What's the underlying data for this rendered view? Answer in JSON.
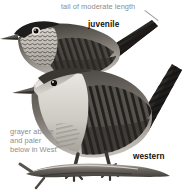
{
  "plate": {
    "kind": "field-guide-bird-illustration",
    "subject": "wren",
    "background": "#ffffff",
    "palette": {
      "ink_dark": "#2b2b2b",
      "ink_mid": "#6f6b66",
      "ink_light": "#c9c5bf",
      "belly_pale": "#e4e1dc",
      "label_gray": "#8d8d8d",
      "label_black": "#111111",
      "branch": "#7d7872"
    }
  },
  "annotations": [
    {
      "id": "tail-length",
      "text": "tail of moderate length",
      "style": "gray",
      "has_leader": true
    },
    {
      "id": "west-plumage",
      "text": "grayer above\nand paler\nbelow in West",
      "style": "gray",
      "has_leader": false
    }
  ],
  "annotation_text": {
    "tail_length": "tail of moderate length",
    "west_line1": "grayer above",
    "west_line2": "and paler",
    "west_line3": "below in West"
  },
  "labels": {
    "juvenile": "juvenile",
    "western": "western"
  },
  "figures": [
    {
      "id": "juvenile-wren",
      "label": "juvenile",
      "position": "upper-left",
      "facing": "left",
      "traits": [
        "dark crown",
        "pale eye-ring",
        "scalloped mottled breast",
        "barred wing",
        "barred tail raised"
      ]
    },
    {
      "id": "western-wren",
      "label": "western",
      "position": "lower-right",
      "facing": "left",
      "perched_on": "branch",
      "traits": [
        "plain gray face",
        "pale supercilium",
        "barred flanks",
        "barred wing coverts",
        "long barred cocked tail"
      ]
    }
  ]
}
